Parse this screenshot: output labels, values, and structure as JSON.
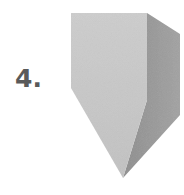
{
  "figure": {
    "label": "4.",
    "shape": "pentagonal-prism-with-pointed-bottom",
    "colors": {
      "front_face": "#c8c8c8",
      "side_face": "#9a9a9a",
      "label": "#5a5a5a",
      "background": "#ffffff"
    }
  }
}
